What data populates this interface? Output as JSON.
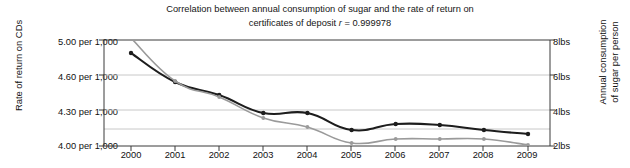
{
  "chart_data": {
    "type": "line",
    "title_line1": "Correlation between annual consumption of sugar and the rate of return on",
    "title_line2_pre": "certificates of deposit ",
    "title_line2_r": "r",
    "title_line2_post": " = 0.999978",
    "title": "Correlation between annual consumption of sugar and the rate of return on certificates of deposit r = 0.999978",
    "xlabel": "",
    "categories": [
      "2000",
      "2001",
      "2002",
      "2003",
      "2004",
      "2005",
      "2006",
      "2007",
      "2008",
      "2009"
    ],
    "x": [
      2000,
      2001,
      2002,
      2003,
      2004,
      2005,
      2006,
      2007,
      2008,
      2009
    ],
    "grid": true,
    "legend_position": "none",
    "left_axis": {
      "label": "Rate of return on CDs",
      "ticks": [
        "5.00 per 1,000",
        "4.60 per 1,000",
        "4.30 per 1,000",
        "4.00 per 1,000"
      ],
      "tick_values": [
        5.0,
        4.6,
        4.3,
        4.0
      ],
      "ylim": [
        4.0,
        5.0
      ]
    },
    "right_axis": {
      "label_line1": "Annual consumption",
      "label_line2": "of sugar per person",
      "label": "Annual consumption of sugar per person",
      "ticks": [
        "8lbs",
        "6lbs",
        "4lbs",
        "2lbs"
      ],
      "tick_values": [
        8,
        6,
        4,
        2
      ],
      "ylim": [
        2,
        8
      ]
    },
    "series": [
      {
        "name": "Rate of return on CDs",
        "axis": "left",
        "color": "#1d1d1d",
        "marker": "circle",
        "values": [
          4.93,
          4.71,
          4.62,
          4.43,
          4.42,
          4.29,
          4.33,
          4.32,
          4.29,
          4.26
        ],
        "pixel_y": [
          53,
          82,
          95,
          113,
          113,
          130,
          124,
          125,
          130,
          134
        ]
      },
      {
        "name": "Annual consumption of sugar per person",
        "axis": "right",
        "color": "#9a9a9a",
        "marker": "circle",
        "values": [
          8.2,
          7.0,
          6.4,
          5.1,
          4.5,
          3.3,
          3.6,
          3.6,
          3.6,
          3.2
        ],
        "pixel_y": [
          38,
          81,
          97,
          118,
          127,
          143,
          139,
          139,
          139,
          145
        ]
      }
    ]
  },
  "colors": {
    "series_dark": "#1d1d1d",
    "series_gray": "#9a9a9a",
    "grid": "#c8c8c8",
    "axis": "#3b3b3b",
    "background": "#ffffff",
    "text": "#161616"
  }
}
